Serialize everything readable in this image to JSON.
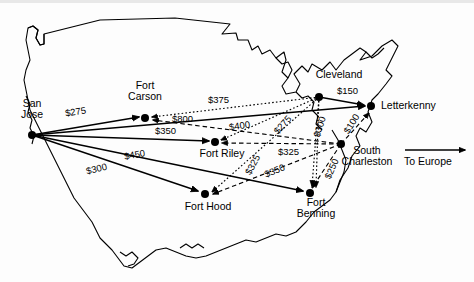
{
  "map": {
    "region": "Continental United States outline",
    "destination_note": {
      "label": "To Europe",
      "arrow": "right-arrow-icon"
    }
  },
  "nodes": [
    {
      "id": "san-jose",
      "label": "San\nJose",
      "x": 32,
      "y": 135,
      "label_x": 32,
      "label_y": 105,
      "role": "origin"
    },
    {
      "id": "fort-carson",
      "label": "Fort\nCarson",
      "x": 145,
      "y": 118,
      "label_x": 145,
      "label_y": 82,
      "role": "depot"
    },
    {
      "id": "fort-riley",
      "label": "Fort Riley",
      "x": 215,
      "y": 142,
      "label_x": 222,
      "label_y": 148,
      "role": "depot"
    },
    {
      "id": "fort-hood",
      "label": "Fort Hood",
      "x": 205,
      "y": 194,
      "label_x": 208,
      "label_y": 200,
      "role": "depot"
    },
    {
      "id": "fort-benning",
      "label": "Fort\nBenning",
      "x": 310,
      "y": 193,
      "label_x": 316,
      "label_y": 199,
      "role": "depot"
    },
    {
      "id": "south-charleston",
      "label": "South\nCharleston",
      "x": 341,
      "y": 144,
      "label_x": 363,
      "label_y": 147,
      "role": "port"
    },
    {
      "id": "cleveland",
      "label": "Cleveland",
      "x": 319,
      "y": 97,
      "label_x": 338,
      "label_y": 76,
      "role": "port"
    },
    {
      "id": "letterkenny",
      "label": "Letterkenny",
      "x": 371,
      "y": 106,
      "label_x": 420,
      "label_y": 104,
      "role": "destination"
    }
  ],
  "edges": [
    {
      "id": "san-jose-fort-carson",
      "from": "san-jose",
      "to": "fort-carson",
      "cost": "$275",
      "style": "solid",
      "label_x": 84,
      "label_y": 113
    },
    {
      "id": "san-jose-fort-riley",
      "from": "san-jose",
      "to": "fort-riley",
      "cost": "$350",
      "style": "solid",
      "label_x": 172,
      "label_y": 131
    },
    {
      "id": "san-jose-fort-hood",
      "from": "san-jose",
      "to": "fort-hood",
      "cost": "$450",
      "style": "solid",
      "label_x": 142,
      "label_y": 155
    },
    {
      "id": "san-jose-fort-benning",
      "from": "san-jose",
      "to": "fort-benning",
      "cost": "$300",
      "style": "solid",
      "label_x": 126,
      "label_y": 170
    },
    {
      "id": "cleveland-fort-carson",
      "from": "cleveland",
      "to": "fort-carson",
      "cost": "$375",
      "style": "dotted",
      "label_x": 225,
      "label_y": 100
    },
    {
      "id": "south-charleston-fort-carson",
      "from": "south-charleston",
      "to": "fort-carson",
      "cost": "$800",
      "style": "dashed",
      "label_x": 190,
      "label_y": 119
    },
    {
      "id": "south-charleston-fort-riley",
      "from": "south-charleston",
      "to": "fort-riley",
      "cost": "$400",
      "style": "dashed",
      "label_x": 248,
      "label_y": 126
    },
    {
      "id": "cleveland-fort-riley",
      "from": "cleveland",
      "to": "fort-riley",
      "cost": "$275",
      "style": "dotted",
      "label_x": 291,
      "label_y": 126
    },
    {
      "id": "cleveland-fort-benning",
      "from": "cleveland",
      "to": "fort-benning",
      "cost": "$300",
      "style": "dotted",
      "label_x": 321,
      "label_y": 128
    },
    {
      "id": "south-charleston-letterkenny",
      "from": "south-charleston",
      "to": "letterkenny",
      "cost": "$100",
      "style": "dashed",
      "label_x": 351,
      "label_y": 125
    },
    {
      "id": "cleveland-letterkenny",
      "from": "cleveland",
      "to": "letterkenny",
      "cost": "$150",
      "style": "solid",
      "label_x": 357,
      "label_y": 90
    },
    {
      "id": "cleveland-fort-hood",
      "from": "cleveland",
      "to": "fort-hood",
      "cost": "$325",
      "style": "dotted",
      "label_x": 258,
      "label_y": 167
    },
    {
      "id": "south-charleston-fort-hood",
      "from": "south-charleston",
      "to": "fort-hood",
      "cost": "$325",
      "style": "dashed",
      "label_x": 295,
      "label_y": 152
    },
    {
      "id": "south-charleston-fort-benning",
      "from": "south-charleston",
      "to": "fort-benning",
      "cost": "$350",
      "style": "dashed",
      "label_x": 281,
      "label_y": 172
    },
    {
      "id": "cleveland-fort-benning-alt",
      "from": "cleveland",
      "to": "fort-benning",
      "cost": "$250",
      "style": "dotted",
      "label_x": 331,
      "label_y": 171
    }
  ]
}
